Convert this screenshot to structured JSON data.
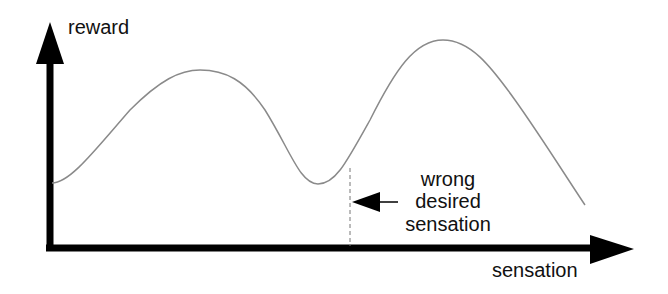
{
  "diagram": {
    "axes": {
      "y_label": "reward",
      "x_label": "sensation"
    },
    "annotation": {
      "lines": [
        "wrong",
        "desired",
        "sensation"
      ]
    },
    "curve": {
      "description": "reward as a function of sensation with two peaks; the second peak is higher",
      "color": "#8a8a8a"
    },
    "axis_color": "#000000"
  }
}
